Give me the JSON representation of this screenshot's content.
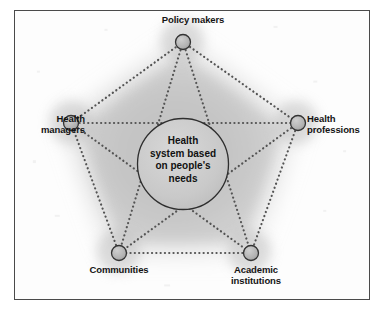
{
  "figure": {
    "type": "pentagon-stakeholder-diagram",
    "center": {
      "text": "Health\nsystem based\non people's\nneeds",
      "shape": "circle"
    },
    "nodes": [
      {
        "id": "policy-makers",
        "label": "Policy makers",
        "position": "top"
      },
      {
        "id": "health-professions",
        "label": "Health\nprofessions",
        "position": "right"
      },
      {
        "id": "academic-institutions",
        "label": "Academic\ninstitutions",
        "position": "bottom-right"
      },
      {
        "id": "communities",
        "label": "Communities",
        "position": "bottom-left"
      },
      {
        "id": "health-managers",
        "label": "Health\nmanagers",
        "position": "left"
      }
    ],
    "connections": {
      "perimeter": "dotted",
      "spokes": "dotted",
      "star": "dotted"
    },
    "colors": {
      "frame": "#4a4a4a",
      "node_fill": "#b4b4b4",
      "node_stroke": "#3a3a3a",
      "dot_line": "#5a5a5a",
      "center_fill": "#c9c9c9",
      "center_stroke": "#2e2e2e",
      "glow": "#a8a8a8",
      "background": "#fdfdfd",
      "text": "#141414"
    }
  }
}
